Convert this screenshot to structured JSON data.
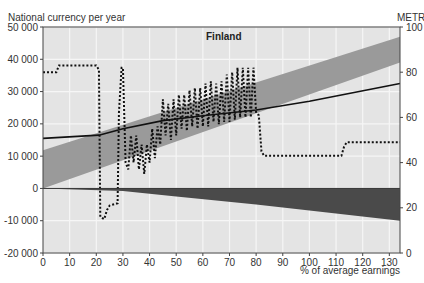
{
  "chart_data": {
    "type": "line",
    "title": "Finland",
    "ylabel_left": "National currency per year",
    "ylabel_right": "METR",
    "xlabel": "% of average earnings",
    "xlim": [
      0,
      134
    ],
    "ylim_left": [
      -20000,
      50000
    ],
    "ylim_right": [
      0,
      100
    ],
    "x_ticks": [
      0,
      10,
      20,
      30,
      40,
      50,
      60,
      70,
      80,
      90,
      100,
      110,
      120,
      130
    ],
    "y_ticks_left": [
      {
        "value": 50000,
        "label": "50 000"
      },
      {
        "value": 40000,
        "label": "40 000"
      },
      {
        "value": 30000,
        "label": "30 000"
      },
      {
        "value": 20000,
        "label": "20 000"
      },
      {
        "value": 10000,
        "label": "10 000"
      },
      {
        "value": 0,
        "label": "0"
      },
      {
        "value": -10000,
        "label": "-10 000"
      },
      {
        "value": -20000,
        "label": "-20 000"
      }
    ],
    "y_ticks_right": [
      100,
      80,
      60,
      40,
      20,
      0
    ],
    "grid": true,
    "series": [
      {
        "name": "Gross earnings band",
        "kind": "area-band",
        "color": "#9a9a9a",
        "upper": [
          [
            0,
            11800
          ],
          [
            134,
            47000
          ]
        ],
        "lower": [
          [
            0,
            0
          ],
          [
            134,
            39000
          ]
        ]
      },
      {
        "name": "Net income",
        "kind": "line",
        "axis": "left",
        "color": "#111111",
        "points": [
          [
            0,
            15500
          ],
          [
            21,
            16500
          ],
          [
            30,
            18500
          ],
          [
            45,
            21000
          ],
          [
            60,
            22500
          ],
          [
            80,
            24300
          ],
          [
            100,
            27000
          ],
          [
            134,
            32500
          ]
        ]
      },
      {
        "name": "Taxes and contributions",
        "kind": "area-below-zero",
        "axis": "left",
        "color": "#4a4a4a",
        "points": [
          [
            0,
            0
          ],
          [
            30,
            -800
          ],
          [
            50,
            -2500
          ],
          [
            80,
            -5000
          ],
          [
            100,
            -6800
          ],
          [
            134,
            -10000
          ]
        ]
      },
      {
        "name": "METR",
        "kind": "dotted-line",
        "axis": "right",
        "color": "#111111",
        "points": [
          [
            0,
            80
          ],
          [
            5,
            80
          ],
          [
            6,
            83
          ],
          [
            20,
            83
          ],
          [
            21,
            81
          ],
          [
            21.5,
            16
          ],
          [
            23,
            15
          ],
          [
            24,
            19
          ],
          [
            25,
            21
          ],
          [
            28,
            22
          ],
          [
            28.5,
            62
          ],
          [
            29.5,
            82
          ],
          [
            30,
            82
          ],
          [
            31,
            40
          ],
          [
            32,
            37
          ],
          [
            33,
            52
          ],
          [
            34,
            40
          ],
          [
            35,
            52
          ],
          [
            36,
            37
          ],
          [
            37,
            48
          ],
          [
            38,
            35
          ],
          [
            39,
            48
          ],
          [
            40,
            40
          ],
          [
            41,
            55
          ],
          [
            42,
            42
          ],
          [
            43,
            56
          ],
          [
            44,
            48
          ],
          [
            45,
            68
          ],
          [
            46,
            52
          ],
          [
            47,
            66
          ],
          [
            48,
            50
          ],
          [
            49,
            68
          ],
          [
            50,
            52
          ],
          [
            51,
            70
          ],
          [
            52,
            55
          ],
          [
            53,
            70
          ],
          [
            54,
            54
          ],
          [
            55,
            72
          ],
          [
            56,
            56
          ],
          [
            57,
            73
          ],
          [
            58,
            55
          ],
          [
            59,
            73
          ],
          [
            60,
            56
          ],
          [
            61,
            75
          ],
          [
            62,
            56
          ],
          [
            63,
            76
          ],
          [
            64,
            58
          ],
          [
            65,
            75
          ],
          [
            66,
            57
          ],
          [
            67,
            76
          ],
          [
            68,
            58
          ],
          [
            69,
            79
          ],
          [
            70,
            58
          ],
          [
            71,
            80
          ],
          [
            72,
            59
          ],
          [
            73,
            82
          ],
          [
            74,
            60
          ],
          [
            75,
            82
          ],
          [
            76,
            60
          ],
          [
            77,
            82
          ],
          [
            78,
            60
          ],
          [
            79,
            82
          ],
          [
            80,
            62
          ],
          [
            81,
            61
          ],
          [
            82,
            45
          ],
          [
            83,
            43
          ],
          [
            112,
            43
          ],
          [
            113,
            47
          ],
          [
            114,
            49
          ],
          [
            134,
            49
          ]
        ]
      }
    ]
  },
  "colors": {
    "plot_bg": "#e4e4e4",
    "grid": "#f6f6f6",
    "band": "#9a9a9a",
    "wedge": "#4a4a4a",
    "line": "#111111"
  }
}
